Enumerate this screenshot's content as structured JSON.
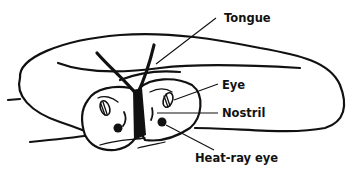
{
  "diagram": {
    "labels": {
      "tongue": "Tongue",
      "eye": "Eye",
      "nostril": "Nostril",
      "heat_ray_eye": "Heat-ray eye"
    },
    "colors": {
      "ink": "#111111",
      "background": "#ffffff"
    }
  }
}
